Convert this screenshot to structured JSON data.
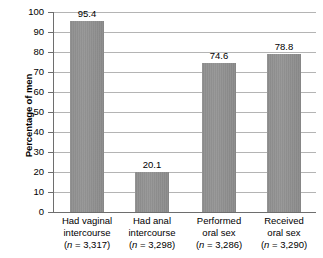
{
  "chart_data": {
    "type": "bar",
    "title": "",
    "xlabel": "",
    "ylabel": "Percentage of men",
    "categories": [
      "Had vaginal intercourse",
      "Had anal intercourse",
      "Performed oral sex",
      "Received oral sex"
    ],
    "category_lines": [
      [
        "Had vaginal",
        "intercourse"
      ],
      [
        "Had anal",
        "intercourse"
      ],
      [
        "Performed",
        "oral sex"
      ],
      [
        "Received",
        "oral sex"
      ]
    ],
    "sample_sizes": [
      "3,317",
      "3,298",
      "3,286",
      "3,290"
    ],
    "sample_size_labels": [
      "(n = 3,317)",
      "(n = 3,298)",
      "(n = 3,286)",
      "(n = 3,290)"
    ],
    "values": [
      95.4,
      20.1,
      74.6,
      78.8
    ],
    "value_labels": [
      "95.4",
      "20.1",
      "74.6",
      "78.8"
    ],
    "ylim": [
      0,
      100
    ],
    "ytick_step": 10,
    "ytick_labels": [
      "100",
      "90",
      "80",
      "70",
      "60",
      "50",
      "40",
      "30",
      "20",
      "10",
      "0"
    ],
    "ytick_values": [
      100,
      90,
      80,
      70,
      60,
      50,
      40,
      30,
      20,
      10,
      0
    ],
    "grid": true,
    "grid_axis": "y",
    "legend": false,
    "legend_position": "none",
    "bar_color": "#8d8d8d",
    "gridline_color": "#b4b4b4",
    "axis_color": "#6e6e6e",
    "text_color": "#000000",
    "background_color": "#ffffff"
  }
}
